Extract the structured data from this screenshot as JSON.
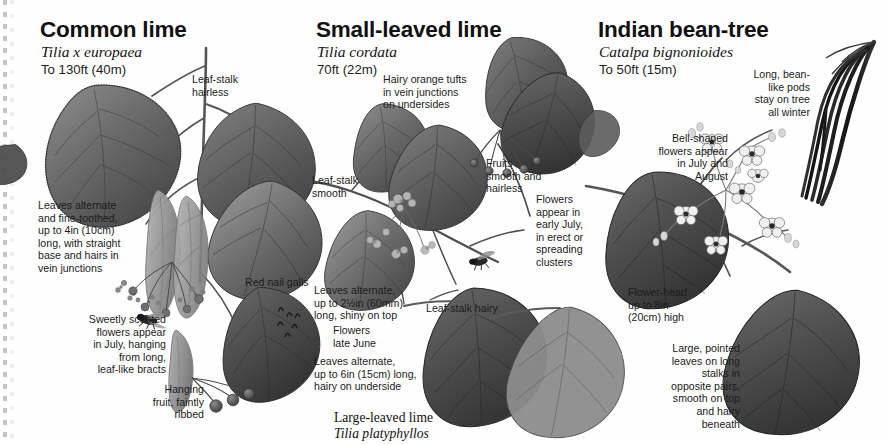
{
  "page": {
    "kind": "field-guide-plate",
    "background": "#fefefe",
    "ink": "#1c1c1c"
  },
  "species": [
    {
      "id": "common-lime",
      "title": "Common lime",
      "latin": "Tilia x europaea",
      "height": "To 130ft (40m)"
    },
    {
      "id": "small-leaved-lime",
      "title": "Small-leaved lime",
      "latin": "Tilia cordata",
      "height": "70ft (22m)"
    },
    {
      "id": "indian-bean-tree",
      "title": "Indian bean-tree",
      "latin": "Catalpa bignonioides",
      "height": "To 50ft (15m)"
    }
  ],
  "captions": {
    "leaf_stalk_hairless": "Leaf-stalk\nhairless",
    "leaves_alternate_fine_toothed": "Leaves alternate\nand fine-toothed,\nup to 4in (10cm)\nlong, with straight\nbase and hairs in\nvein junctions",
    "sweetly_scented": "Sweetly scented\nflowers appear\nin July, hanging\nfrom long,\nleaf-like bracts",
    "red_nail_galls": "Red nail galls",
    "hanging_fruit": "Hanging\nfruit, faintly\nribbed",
    "hairy_orange_tufts": "Hairy orange tufts\nin vein junctions\non undersides",
    "leaf_stalk_smooth": "Leaf-stalk\nsmooth",
    "fruits_smooth": "Fruits\nsmooth and\nhairless",
    "flowers_early_july": "Flowers\nappear in\nearly July,\nin erect or\nspreading\nclusters",
    "leaves_alternate_shiny": "Leaves alternate,\nup to 2½in (60mm)\nlong, shiny on top",
    "leaf_stalk_hairy": "Leaf-stalk hairy",
    "flowers_late_june": "Flowers\nlate June",
    "leaves_alternate_hairy": "Leaves alternate,\nup to 6in (15cm) long,\nhairy on underside",
    "long_bean_pods": "Long, bean-\nlike pods\nstay on tree\nall winter",
    "bell_shaped_flowers": "Bell-shaped\nflowers appear\nin July and\nAugust",
    "flower_head": "Flower-head\nup to 8in\n(20cm) high",
    "large_pointed_leaves": "Large, pointed\nleaves on long\nstalks in\nopposite pairs,\nsmooth on top\nand hairy\nbeneath"
  },
  "sub_species": {
    "large_leaved_lime_name": "Large-leaved lime",
    "large_leaved_lime_latin": "Tilia platyphyllos"
  }
}
